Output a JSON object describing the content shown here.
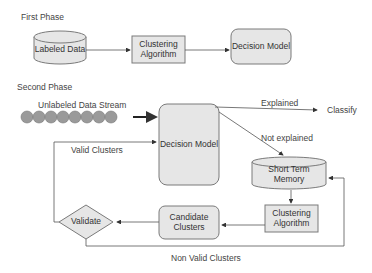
{
  "phases": {
    "first": {
      "title": "First Phase"
    },
    "second": {
      "title": "Second Phase"
    }
  },
  "nodes": {
    "labeled_data": "Labeled Data",
    "clustering_algorithm_1": "Clustering Algorithm",
    "decision_model_1": "Decision Model",
    "unlabeled_stream": "Unlabeled Data Stream",
    "decision_model_2": "Decision Model",
    "short_term_memory": "Short Term Memory",
    "clustering_algorithm_2": "Clustering Algorithm",
    "candidate_clusters": "Candidate Clusters",
    "validate": "Validate",
    "classify": "Classify"
  },
  "edges": {
    "explained": "Explained",
    "not_explained": "Not explained",
    "valid_clusters": "Valid Clusters",
    "non_valid_clusters": "Non Valid Clusters"
  },
  "colors": {
    "box_fill": "#e6e6e6",
    "stroke": "#7a7a7a",
    "stream_circle": "#9a9a9a"
  }
}
